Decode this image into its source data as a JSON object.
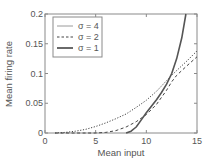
{
  "chart_data": {
    "type": "line",
    "title": "",
    "xlabel": "Mean input",
    "ylabel": "Mean firing rate",
    "xlim": [
      0,
      15
    ],
    "ylim": [
      0,
      0.2
    ],
    "xticks": [
      0,
      5,
      10,
      15
    ],
    "xtick_labels": [
      "0",
      "5",
      "10",
      "15"
    ],
    "yticks": [
      0,
      0.05,
      0.1,
      0.15,
      0.2
    ],
    "ytick_labels": [
      "0",
      "0.05",
      "0.1",
      "0.15",
      "0.2"
    ],
    "grid": false,
    "legend_position": "upper left",
    "legend": [
      {
        "label": "σ = 4",
        "style": "thin-solid"
      },
      {
        "label": "σ = 2",
        "style": "dashed"
      },
      {
        "label": "σ = 1",
        "style": "thick-solid"
      }
    ],
    "series": [
      {
        "name": "σ = 4",
        "plot_style": "dotted",
        "x": [
          1,
          2,
          3,
          4,
          5,
          6,
          7,
          8,
          9,
          10,
          11,
          12,
          12.5,
          13,
          14,
          15
        ],
        "y": [
          0,
          0.001,
          0.003,
          0.006,
          0.011,
          0.017,
          0.024,
          0.032,
          0.043,
          0.055,
          0.07,
          0.088,
          0.097,
          0.105,
          0.121,
          0.138
        ]
      },
      {
        "name": "σ = 2",
        "plot_style": "dashed",
        "x": [
          1,
          5,
          6,
          7,
          8,
          9,
          10,
          11,
          12,
          12.5,
          13,
          14,
          15
        ],
        "y": [
          0,
          0,
          0.001,
          0.004,
          0.01,
          0.019,
          0.031,
          0.048,
          0.072,
          0.086,
          0.097,
          0.113,
          0.128
        ]
      },
      {
        "name": "σ = 1",
        "plot_style": "solid-thick",
        "x": [
          8,
          8.5,
          9,
          9.5,
          10,
          10.5,
          11,
          11.5,
          12,
          12.5,
          13,
          13.5,
          13.9
        ],
        "y": [
          0,
          0.003,
          0.01,
          0.022,
          0.034,
          0.045,
          0.056,
          0.068,
          0.082,
          0.1,
          0.125,
          0.16,
          0.2
        ]
      }
    ]
  }
}
